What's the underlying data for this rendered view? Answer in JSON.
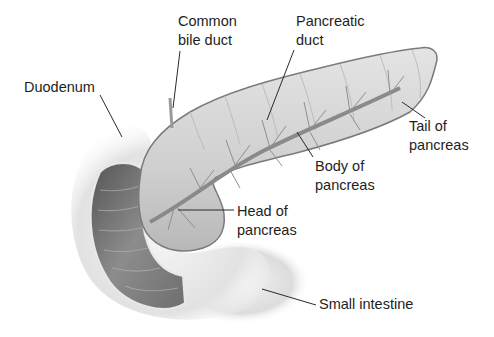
{
  "diagram": {
    "labels": [
      {
        "id": "common-bile-duct",
        "lines": [
          "Common",
          "bile duct"
        ]
      },
      {
        "id": "pancreatic-duct",
        "lines": [
          "Pancreatic",
          "duct"
        ]
      },
      {
        "id": "duodenum",
        "lines": [
          "Duodenum"
        ]
      },
      {
        "id": "tail-of-pancreas",
        "lines": [
          "Tail of",
          "pancreas"
        ]
      },
      {
        "id": "body-of-pancreas",
        "lines": [
          "Body of",
          "pancreas"
        ]
      },
      {
        "id": "head-of-pancreas",
        "lines": [
          "Head of",
          "pancreas"
        ]
      },
      {
        "id": "small-intestine",
        "lines": [
          "Small intestine"
        ]
      }
    ],
    "colors": {
      "background": "#ffffff",
      "label_text": "#1e1e1e",
      "leader_line": "#2a2a2a",
      "pancreas_fill": "#d4d4d4",
      "pancreas_edge": "#6a6a6a",
      "duct": "#8a8a8a",
      "duodenum_outer": "#ececec",
      "duodenum_inner": "#7a7a7a"
    }
  }
}
